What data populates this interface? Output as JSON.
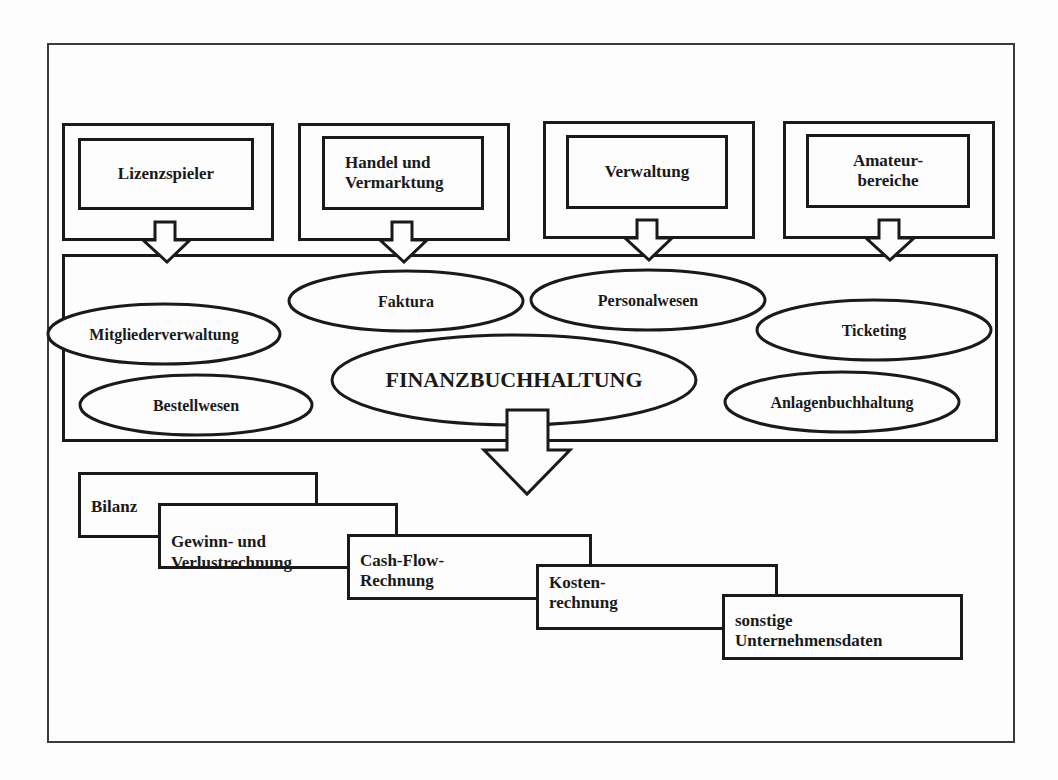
{
  "diagram": {
    "source_areas": [
      {
        "label": "Lizenzspieler"
      },
      {
        "label": "Handel und\nVermarktung"
      },
      {
        "label": "Verwaltung"
      },
      {
        "label": "Amateur-\nbereiche"
      }
    ],
    "modules": [
      {
        "label": "Mitgliederverwaltung"
      },
      {
        "label": "Faktura"
      },
      {
        "label": "Personalwesen"
      },
      {
        "label": "Ticketing"
      },
      {
        "label": "Bestellwesen"
      },
      {
        "label": "FINANZBUCHHALTUNG"
      },
      {
        "label": "Anlagenbuchhaltung"
      }
    ],
    "outputs": [
      {
        "label": "Bilanz"
      },
      {
        "label": "Gewinn- und\nVerlustrechnung"
      },
      {
        "label": "Cash-Flow-\nRechnung"
      },
      {
        "label": "Kosten-\nrechnung"
      },
      {
        "label": "sonstige\nUnternehmensdaten"
      }
    ]
  }
}
